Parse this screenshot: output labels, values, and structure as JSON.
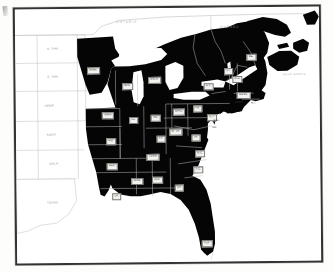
{
  "map": {
    "title": "Eastern United States shaded map",
    "description": "Black-and-white printed map plate of the eastern United States with shaded (black) states, unshaded western states, the Great Lakes, and Canadian provinces.",
    "colors": {
      "shaded_state": "#050505",
      "open_state": "#ffffff",
      "state_border": "#bdbdbd",
      "open_border": "#c9c9c9",
      "frame": "#333333",
      "label_box": "#f2f2ee",
      "label_text": "#1a1a1a",
      "geo_text": "#9a9a9a"
    },
    "shaded_states": [
      {
        "id": "minnesota",
        "label": "MINN.",
        "x": 78,
        "y": 62
      },
      {
        "id": "wisconsin",
        "label": "WIS.",
        "x": 112,
        "y": 78
      },
      {
        "id": "michigan",
        "label": "MICH.",
        "x": 139,
        "y": 72
      },
      {
        "id": "iowa",
        "label": "IOWA",
        "x": 92,
        "y": 107
      },
      {
        "id": "illinois",
        "label": "ILL.",
        "x": 118,
        "y": 112
      },
      {
        "id": "indiana",
        "label": "IND.",
        "x": 140,
        "y": 110
      },
      {
        "id": "ohio",
        "label": "OHIO",
        "x": 163,
        "y": 104
      },
      {
        "id": "missouri",
        "label": "MO.",
        "x": 95,
        "y": 133
      },
      {
        "id": "kentucky",
        "label": "KY.",
        "x": 145,
        "y": 131
      },
      {
        "id": "tennessee",
        "label": "TENN.",
        "x": 137,
        "y": 149
      },
      {
        "id": "arkansas",
        "label": "ARK.",
        "x": 96,
        "y": 158
      },
      {
        "id": "louisiana",
        "label": "LA.",
        "x": 100,
        "y": 188
      },
      {
        "id": "mississippi",
        "label": "MISS.",
        "x": 121,
        "y": 173
      },
      {
        "id": "alabama",
        "label": "ALA.",
        "x": 141,
        "y": 172
      },
      {
        "id": "georgia",
        "label": "GA.",
        "x": 163,
        "y": 180
      },
      {
        "id": "florida",
        "label": "FLA.",
        "x": 190,
        "y": 236
      },
      {
        "id": "south-carolina",
        "label": "S.C.",
        "x": 182,
        "y": 162
      },
      {
        "id": "north-carolina",
        "label": "N.C.",
        "x": 184,
        "y": 146
      },
      {
        "id": "virginia",
        "label": "VA.",
        "x": 180,
        "y": 130
      },
      {
        "id": "west-virginia",
        "label": "W. VA.",
        "x": 160,
        "y": 124
      },
      {
        "id": "pennsylvania",
        "label": "PA.",
        "x": 182,
        "y": 101
      },
      {
        "id": "new-york",
        "label": "N.Y.",
        "x": 193,
        "y": 79
      },
      {
        "id": "vermont",
        "label": "VT.",
        "x": 213,
        "y": 64
      },
      {
        "id": "new-hampshire",
        "label": "N.H.",
        "x": 222,
        "y": 72
      },
      {
        "id": "maine",
        "label": "ME.",
        "x": 236,
        "y": 50
      },
      {
        "id": "massachusetts",
        "label": "MASS.",
        "x": 228,
        "y": 88
      },
      {
        "id": "new-jersey",
        "label": "N.J.",
        "x": 196,
        "y": 110
      }
    ],
    "coast_callouts": [
      {
        "id": "connecticut",
        "label": "CONN.",
        "x": 224,
        "y": 95
      },
      {
        "id": "rhode-island",
        "label": "R.I.",
        "x": 238,
        "y": 96
      },
      {
        "id": "maryland",
        "label": "MD.",
        "x": 199,
        "y": 120
      },
      {
        "id": "delaware",
        "label": "DEL.",
        "x": 201,
        "y": 113
      }
    ],
    "open_states": [
      {
        "id": "north-dakota",
        "label": "N. DAK.",
        "x": 38,
        "y": 40
      },
      {
        "id": "south-dakota",
        "label": "S. DAK.",
        "x": 38,
        "y": 68
      },
      {
        "id": "nebraska",
        "label": "NEBR.",
        "x": 34,
        "y": 97
      },
      {
        "id": "kansas",
        "label": "KANS.",
        "x": 36,
        "y": 126
      },
      {
        "id": "oklahoma",
        "label": "OKLA.",
        "x": 38,
        "y": 155
      },
      {
        "id": "texas",
        "label": "TEXAS",
        "x": 36,
        "y": 194
      }
    ],
    "geography": [
      {
        "id": "ontario",
        "label": "ONTARIO",
        "x": 112,
        "y": 14
      },
      {
        "id": "quebec",
        "label": "QUEBEC",
        "x": 215,
        "y": 20
      },
      {
        "id": "nova-scotia",
        "label": "NOVA SCOTIA",
        "x": 279,
        "y": 68
      }
    ]
  }
}
